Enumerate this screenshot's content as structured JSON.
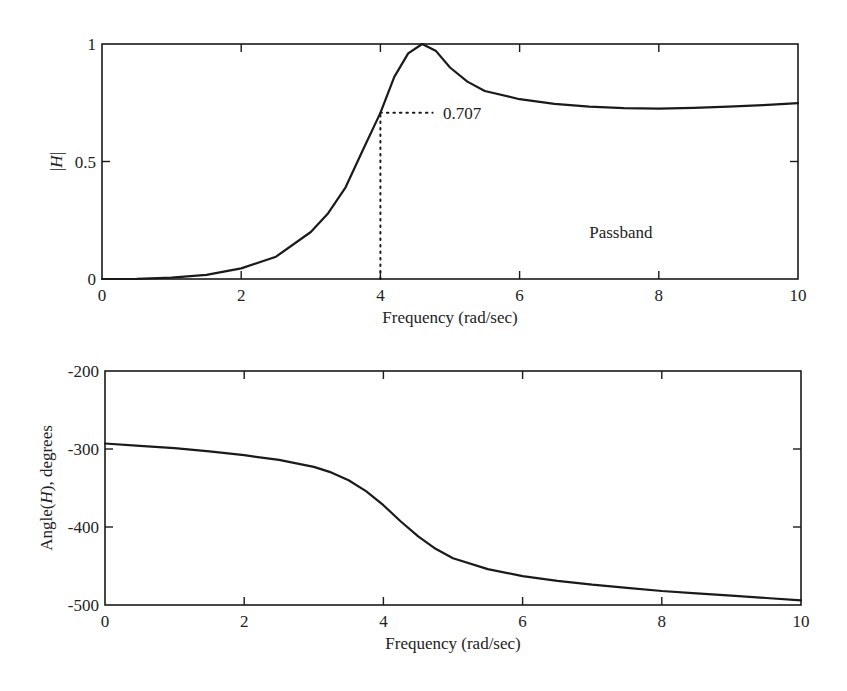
{
  "chart_data": [
    {
      "type": "line",
      "title": "",
      "xlabel": "Frequency (rad/sec)",
      "ylabel": "|H|",
      "ylabel_parts": {
        "pre": "|",
        "italic": "H",
        "post": "|"
      },
      "xlim": [
        0,
        10
      ],
      "ylim": [
        0,
        1
      ],
      "xticks": [
        0,
        2,
        4,
        6,
        8,
        10
      ],
      "xtick_labels": [
        "0",
        "2",
        "4",
        "6",
        "8",
        "10"
      ],
      "yticks": [
        0,
        0.5,
        1
      ],
      "ytick_labels": [
        "0",
        "0.5",
        "1"
      ],
      "grid": false,
      "legend": null,
      "series": [
        {
          "name": "|H| magnitude",
          "x": [
            0,
            0.5,
            1,
            1.5,
            2,
            2.5,
            3,
            3.25,
            3.5,
            3.75,
            4,
            4.2,
            4.4,
            4.6,
            4.8,
            5,
            5.25,
            5.5,
            6,
            6.5,
            7,
            7.5,
            8,
            8.5,
            9,
            9.5,
            10
          ],
          "values": [
            0,
            0.001,
            0.006,
            0.018,
            0.045,
            0.095,
            0.2,
            0.28,
            0.39,
            0.55,
            0.707,
            0.86,
            0.96,
            1.0,
            0.97,
            0.9,
            0.84,
            0.8,
            0.765,
            0.745,
            0.733,
            0.727,
            0.725,
            0.728,
            0.733,
            0.74,
            0.748
          ]
        }
      ],
      "annotations": [
        {
          "type": "dotted_vertical",
          "x": 4,
          "y_from": 0,
          "y_to": 0.707
        },
        {
          "type": "dotted_horizontal",
          "y": 0.707,
          "x_from": 4,
          "x_to": 4.75
        },
        {
          "type": "text",
          "text": "0.707",
          "x": 4.9,
          "y": 0.707
        },
        {
          "type": "text",
          "text": "Passband",
          "x": 7.0,
          "y": 0.2
        }
      ]
    },
    {
      "type": "line",
      "title": "",
      "xlabel": "Frequency (rad/sec)",
      "ylabel": "Angle(H), degrees",
      "ylabel_parts": {
        "pre": "Angle(",
        "italic": "H",
        "post": "), degrees"
      },
      "xlim": [
        0,
        10
      ],
      "ylim": [
        -500,
        -200
      ],
      "xticks": [
        0,
        2,
        4,
        6,
        8,
        10
      ],
      "xtick_labels": [
        "0",
        "2",
        "4",
        "6",
        "8",
        "10"
      ],
      "yticks": [
        -500,
        -400,
        -300,
        -200
      ],
      "ytick_labels": [
        "-500",
        "-400",
        "-300",
        "-200"
      ],
      "grid": false,
      "legend": null,
      "series": [
        {
          "name": "Phase angle",
          "x": [
            0,
            0.5,
            1,
            1.5,
            2,
            2.5,
            3,
            3.25,
            3.5,
            3.75,
            4,
            4.25,
            4.5,
            4.75,
            5,
            5.5,
            6,
            6.5,
            7,
            7.5,
            8,
            8.5,
            9,
            9.5,
            10
          ],
          "values": [
            -293,
            -296,
            -299,
            -303,
            -308,
            -314,
            -323,
            -330,
            -340,
            -354,
            -372,
            -393,
            -412,
            -428,
            -440,
            -454,
            -463,
            -469,
            -474,
            -478,
            -482,
            -485,
            -488,
            -491,
            -494
          ]
        }
      ],
      "annotations": []
    }
  ]
}
